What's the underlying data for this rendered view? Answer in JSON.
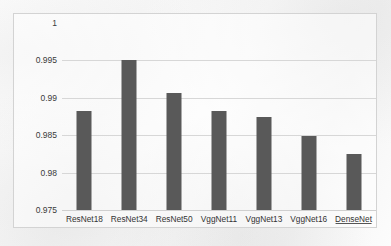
{
  "chart_data": {
    "type": "bar",
    "title": "",
    "xlabel": "",
    "ylabel": "",
    "categories": [
      "ResNet18",
      "ResNet34",
      "ResNet50",
      "VggNet11",
      "VggNet13",
      "VggNet16",
      "DenseNet"
    ],
    "values": [
      0.9882,
      0.995,
      0.9906,
      0.9882,
      0.9874,
      0.9849,
      0.9825
    ],
    "ylim": [
      0.975,
      1
    ],
    "yticks": [
      1,
      0.995,
      0.99,
      0.985,
      0.98,
      0.975
    ],
    "ytick_labels": [
      "1",
      "0.995",
      "0.99",
      "0.985",
      "0.98",
      "0.975"
    ],
    "grid": true,
    "legend": false,
    "legend_position": "none",
    "series": [
      {
        "name": "accuracy",
        "values": [
          0.9882,
          0.995,
          0.9906,
          0.9882,
          0.9874,
          0.9849,
          0.9825
        ]
      }
    ],
    "colors": {
      "bar": "#595959",
      "gridline": "#d7d7d7",
      "border": "#d3d3d3",
      "tick_text": "#333333",
      "background": "#ffffff"
    },
    "annotations": {
      "misspelled_labels": [
        "DenseNet"
      ]
    }
  }
}
